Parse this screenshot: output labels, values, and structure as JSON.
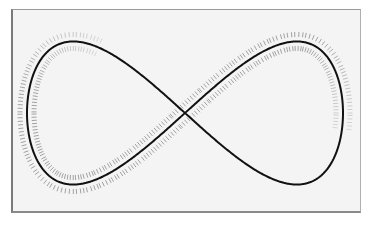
{
  "diagram": {
    "type": "figure-eight track with railway tie marks",
    "frame": {
      "x": 11,
      "y": 9,
      "width": 350,
      "height": 204,
      "background": "#f4f4f4",
      "border": "#7a7a7a"
    },
    "curve": {
      "shape": "figure-eight (lemniscate)",
      "center": [
        185,
        113
      ],
      "left_extent": 27,
      "right_extent": 343,
      "top": 38,
      "bottom": 184,
      "stroke": "#111111",
      "stroke_width": 2
    },
    "ties": {
      "color": "#8c8c8c",
      "spacing": 3.2,
      "offset": 7,
      "length": 5,
      "start_t": 0.62,
      "end_t": 0.27
    }
  }
}
